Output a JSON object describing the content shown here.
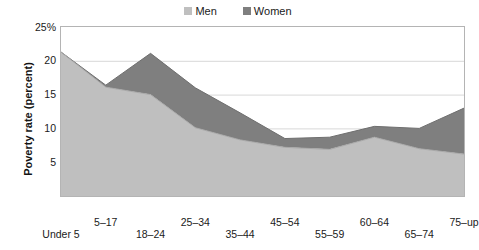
{
  "legend": {
    "position": "top-center",
    "entries": [
      {
        "label": "Men",
        "color": "#bfbfbf",
        "icon": "square-swatch-icon"
      },
      {
        "label": "Women",
        "color": "#7f7f7f",
        "icon": "square-swatch-icon"
      }
    ]
  },
  "axes": {
    "y_title": "Poverty rate (percent)",
    "y_ticks": [
      "25%",
      "20",
      "15",
      "10",
      "5"
    ],
    "y_tick_values": [
      25,
      20,
      15,
      10,
      5
    ],
    "x_title": ""
  },
  "chart_data": {
    "type": "area",
    "stacked": true,
    "title": "",
    "subtitle": "",
    "xlabel": "",
    "ylabel": "Poverty rate (percent)",
    "ylim": [
      0,
      25
    ],
    "ytick_labels": [
      "25%",
      "20",
      "15",
      "10",
      "5"
    ],
    "yticks": [
      25,
      20,
      15,
      10,
      5
    ],
    "grid": true,
    "grid_axis": "y",
    "legend_position": "top-center",
    "categories": [
      "Under 5",
      "5–17",
      "18–24",
      "25–34",
      "35–44",
      "45–54",
      "55–59",
      "60–64",
      "65–74",
      "75–up"
    ],
    "series": [
      {
        "name": "Men",
        "color": "#bfbfbf",
        "values": [
          21.3,
          16.1,
          15.0,
          10.1,
          8.3,
          7.2,
          6.9,
          8.7,
          7.0,
          6.2
        ]
      },
      {
        "name": "Women",
        "color": "#7f7f7f",
        "values": [
          0.0,
          0.3,
          6.1,
          5.9,
          4.0,
          1.3,
          1.8,
          1.6,
          3.0,
          6.8
        ]
      }
    ],
    "stack_totals": [
      21.3,
      16.4,
      21.1,
      16.0,
      12.3,
      8.5,
      8.7,
      10.3,
      10.0,
      13.0
    ],
    "annotations": []
  },
  "colors": {
    "men": "#bfbfbf",
    "women": "#7f7f7f",
    "grid": "#d8d8d8",
    "frame": "#b4b4b4",
    "text": "#1a1a1a",
    "background": "#ffffff"
  }
}
